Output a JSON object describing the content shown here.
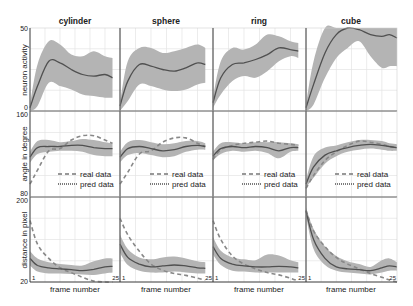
{
  "chart_data": {
    "type": "line",
    "layout": {
      "rows": 3,
      "cols": 4,
      "grid": true,
      "legend_position": "lower right (row 2)"
    },
    "column_titles": [
      "cylinder",
      "sphere",
      "ring",
      "cube"
    ],
    "xlabel": "frame number",
    "x_range": [
      1,
      25
    ],
    "x_tick_labels": [
      "1",
      "25"
    ],
    "colors": {
      "band": "#b4b4b4",
      "line": "#505050",
      "real": "#888888",
      "grid": "#e4e4e4",
      "axis": "#333333"
    },
    "rows": [
      {
        "ylabel": "neuron activity",
        "ylim": [
          0,
          50
        ],
        "y_tick_labels": [
          "0",
          "50"
        ],
        "panels": [
          {
            "title": "cylinder",
            "x": [
              1,
              3,
              6,
              9,
              12,
              15,
              18,
              21,
              23
            ],
            "mean": [
              2,
              15,
              30,
              29,
              25,
              22,
              21,
              22,
              20
            ],
            "upper": [
              4,
              28,
              42,
              40,
              34,
              33,
              36,
              33,
              32
            ],
            "lower": [
              0,
              3,
              17,
              15,
              13,
              10,
              9,
              8,
              8
            ]
          },
          {
            "title": "sphere",
            "x": [
              1,
              3,
              6,
              9,
              12,
              15,
              18,
              21,
              23
            ],
            "mean": [
              3,
              18,
              28,
              27,
              25,
              24,
              26,
              29,
              28
            ],
            "upper": [
              5,
              30,
              38,
              38,
              35,
              36,
              38,
              40,
              38
            ],
            "lower": [
              0,
              6,
              16,
              15,
              13,
              12,
              13,
              16,
              17
            ]
          },
          {
            "title": "ring",
            "x": [
              1,
              3,
              6,
              9,
              12,
              15,
              18,
              21,
              23
            ],
            "mean": [
              5,
              20,
              28,
              29,
              31,
              34,
              38,
              37,
              36
            ],
            "upper": [
              8,
              30,
              38,
              37,
              40,
              46,
              45,
              42,
              41
            ],
            "lower": [
              2,
              10,
              18,
              21,
              20,
              24,
              30,
              33,
              32
            ],
            "note": "ring panel starts mid-line; values approximate"
          },
          {
            "title": "cube",
            "x": [
              1,
              3,
              6,
              9,
              12,
              15,
              18,
              21,
              23,
              25
            ],
            "mean": [
              2,
              16,
              35,
              46,
              50,
              49,
              46,
              45,
              46,
              44
            ],
            "upper": [
              4,
              30,
              50,
              50,
              50,
              50,
              50,
              50,
              50,
              50
            ],
            "lower": [
              0,
              4,
              20,
              32,
              38,
              42,
              33,
              26,
              27,
              27
            ]
          }
        ]
      },
      {
        "ylabel": "angle in degree",
        "ylim": [
          80,
          160
        ],
        "y_tick_labels": [
          "80",
          "160"
        ],
        "legend": [
          "real data",
          "pred data"
        ],
        "panels": [
          {
            "title": "cylinder",
            "x": [
              1,
              3,
              6,
              9,
              12,
              15,
              18,
              21,
              23
            ],
            "pred": [
              117,
              126,
              127,
              127,
              128,
              128,
              126,
              125,
              125
            ],
            "upper": [
              122,
              132,
              133,
              131,
              132,
              134,
              133,
              131,
              130
            ],
            "lower": [
              112,
              120,
              122,
              123,
              123,
              122,
              119,
              118,
              118
            ],
            "real": [
              92,
              105,
              123,
              125,
              133,
              137,
              137,
              133,
              130
            ]
          },
          {
            "title": "sphere",
            "x": [
              1,
              3,
              6,
              9,
              12,
              15,
              18,
              21,
              23
            ],
            "pred": [
              117,
              125,
              127,
              125,
              123,
              124,
              127,
              128,
              127
            ],
            "upper": [
              122,
              131,
              133,
              131,
              129,
              130,
              132,
              132,
              130
            ],
            "lower": [
              112,
              119,
              121,
              119,
              117,
              118,
              122,
              124,
              124
            ],
            "real": [
              92,
              103,
              120,
              123,
              131,
              135,
              135,
              130,
              127
            ]
          },
          {
            "title": "ring",
            "x": [
              1,
              3,
              6,
              9,
              12,
              15,
              18,
              21,
              23
            ],
            "pred": [
              118,
              125,
              127,
              126,
              127,
              126,
              123,
              126,
              126
            ],
            "upper": [
              122,
              130,
              131,
              130,
              131,
              131,
              131,
              130,
              129
            ],
            "lower": [
              114,
              120,
              123,
              122,
              123,
              121,
              116,
              122,
              123
            ],
            "real": [
              115,
              124,
              128,
              130,
              131,
              132,
              130,
              129,
              128
            ]
          },
          {
            "title": "cube",
            "x": [
              1,
              3,
              6,
              9,
              12,
              15,
              18,
              21,
              23,
              25
            ],
            "pred": [
              92,
              108,
              119,
              123,
              126,
              128,
              129,
              128,
              127,
              126
            ],
            "upper": [
              96,
              118,
              126,
              128,
              131,
              133,
              133,
              132,
              130,
              129
            ],
            "lower": [
              89,
              98,
              111,
              118,
              122,
              124,
              125,
              124,
              123,
              123
            ],
            "real": [
              88,
              100,
              114,
              122,
              128,
              132,
              131,
              129,
              127,
              126
            ]
          }
        ]
      },
      {
        "ylabel": "distance in pixel",
        "ylim": [
          20,
          200
        ],
        "y_tick_labels": [
          "20",
          "200"
        ],
        "panels": [
          {
            "title": "cylinder",
            "x": [
              1,
              3,
              6,
              9,
              12,
              15,
              18,
              21,
              23
            ],
            "pred": [
              70,
              55,
              50,
              48,
              46,
              44,
              47,
              52,
              53
            ],
            "upper": [
              85,
              70,
              62,
              58,
              56,
              55,
              64,
              70,
              70
            ],
            "lower": [
              55,
              42,
              38,
              38,
              37,
              36,
              35,
              38,
              40
            ],
            "real": [
              150,
              100,
              70,
              50,
              40,
              30,
              22,
              20,
              20
            ]
          },
          {
            "title": "sphere",
            "x": [
              1,
              3,
              6,
              9,
              12,
              15,
              18,
              21,
              23
            ],
            "pred": [
              100,
              72,
              58,
              52,
              54,
              56,
              54,
              50,
              49
            ],
            "upper": [
              120,
              90,
              72,
              68,
              72,
              74,
              70,
              64,
              62
            ],
            "lower": [
              82,
              56,
              44,
              40,
              40,
              42,
              40,
              38,
              38
            ],
            "real": [
              155,
              120,
              85,
              58,
              45,
              38,
              34,
              28,
              24
            ]
          },
          {
            "title": "ring",
            "x": [
              1,
              3,
              6,
              9,
              12,
              15,
              18,
              21,
              23
            ],
            "pred": [
              95,
              70,
              58,
              54,
              52,
              52,
              53,
              52,
              50
            ],
            "upper": [
              115,
              86,
              72,
              68,
              66,
              78,
              76,
              66,
              62
            ],
            "lower": [
              78,
              56,
              44,
              42,
              40,
              40,
              40,
              40,
              40
            ],
            "real": [
              150,
              110,
              75,
              58,
              48,
              40,
              35,
              28,
              22
            ]
          },
          {
            "title": "cube",
            "x": [
              1,
              3,
              6,
              9,
              12,
              15,
              18,
              21,
              23,
              25
            ],
            "pred": [
              170,
              110,
              70,
              52,
              48,
              46,
              44,
              50,
              54,
              52
            ],
            "upper": [
              178,
              132,
              95,
              75,
              64,
              58,
              52,
              66,
              70,
              62
            ],
            "lower": [
              160,
              90,
              56,
              44,
              40,
              38,
              36,
              40,
              44,
              44
            ],
            "real": [
              172,
              128,
              95,
              72,
              58,
              48,
              38,
              30,
              24,
              20
            ]
          }
        ]
      }
    ]
  },
  "labels": {
    "title_cylinder": "cylinder",
    "title_sphere": "sphere",
    "title_ring": "ring",
    "title_cube": "cube",
    "ylabel_row1": "neuron activity",
    "ylabel_row2": "angle in degree",
    "ylabel_row3": "distance in pixel",
    "ytick_r1_top": "50",
    "ytick_r1_bot": "0",
    "ytick_r2_top": "160",
    "ytick_r2_bot": "80",
    "ytick_r3_top": "200",
    "ytick_r3_bot": "20",
    "xlabel": "frame number",
    "xtick_start": "1",
    "xtick_end": "25",
    "legend_real": "real data",
    "legend_pred": "pred data"
  }
}
